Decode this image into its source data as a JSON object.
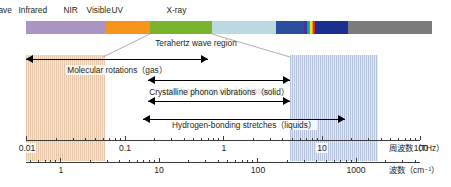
{
  "figure": {
    "background": "#ffffff"
  },
  "spectrum_bar": {
    "segments": [
      {
        "name": "radio-wave",
        "color": "#ab94c0",
        "x": 26,
        "w": 80
      },
      {
        "name": "microwave",
        "color": "#f7941e",
        "x": 106,
        "w": 44
      },
      {
        "name": "terahertz-wave",
        "color": "#7ab32e",
        "x": 150,
        "w": 62
      },
      {
        "name": "infrared",
        "color": "#bcd8e0",
        "x": 212,
        "w": 64
      },
      {
        "name": "nir",
        "color": "#2b4f9e",
        "x": 276,
        "w": 28
      },
      {
        "name": "visible-violet",
        "color": "#5b2d8e",
        "x": 304,
        "w": 1.5
      },
      {
        "name": "visible-blue",
        "color": "#1c3fa0",
        "x": 305.5,
        "w": 1.5
      },
      {
        "name": "visible-cyan",
        "color": "#00a7c4",
        "x": 307,
        "w": 1.5
      },
      {
        "name": "visible-green",
        "color": "#42b54a",
        "x": 308.5,
        "w": 1.5
      },
      {
        "name": "visible-yellow",
        "color": "#f6e600",
        "x": 310,
        "w": 1.5
      },
      {
        "name": "visible-orange",
        "color": "#f7941e",
        "x": 311.5,
        "w": 1.5
      },
      {
        "name": "visible-red",
        "color": "#e0252b",
        "x": 313,
        "w": 2
      },
      {
        "name": "uv",
        "color": "#1b2f91",
        "x": 315,
        "w": 33
      },
      {
        "name": "x-ray",
        "color": "#7b7b7b",
        "x": 348,
        "w": 84
      }
    ],
    "top": 21,
    "height": 13,
    "labels": [
      {
        "name": "radio-wave",
        "text": "Radio wave",
        "cx": 66,
        "y": 5
      },
      {
        "name": "microwave",
        "text": "Microwave",
        "cx": 128,
        "y": 5
      },
      {
        "name": "terahertz-wave",
        "text": "Terahertz wave",
        "cx": 181,
        "y": 5
      },
      {
        "name": "infrared",
        "text": "Infrared",
        "cx": 244,
        "y": 5
      },
      {
        "name": "nir",
        "text": "NIR",
        "cx": 289,
        "y": 5
      },
      {
        "name": "visible",
        "text": "Visible",
        "cx": 312,
        "y": 5
      },
      {
        "name": "uv",
        "text": "UV",
        "cx": 337,
        "y": 5
      },
      {
        "name": "x-ray",
        "text": "X-ray",
        "cx": 392,
        "y": 5
      }
    ]
  },
  "bands": [
    {
      "name": "terahertz-band-low",
      "color": "orange",
      "x": 26,
      "w": 79,
      "top": 55,
      "h": 106
    },
    {
      "name": "terahertz-band-high",
      "color": "blue",
      "x": 290,
      "w": 88,
      "top": 55,
      "h": 106
    }
  ],
  "callout": {
    "label": "Terahertz wave region",
    "label_cx": 196,
    "label_y": 38,
    "left_top_x": 150,
    "right_top_x": 212,
    "top_y": 34,
    "left_bottom_x": 103,
    "right_bottom_x": 290,
    "bottom_y": 57,
    "color": "#9a9a9a"
  },
  "arrows": [
    {
      "name": "molecular-rotations",
      "label": "Molecular rotations（gas）",
      "x1": 26,
      "x2": 208,
      "y": 55,
      "head_left": true,
      "head_right": true,
      "label_cx": 117,
      "label_y": 65
    },
    {
      "name": "low-frequency-bond-vibrations",
      "label": "Low frequency bond vibrations",
      "x1": 148,
      "x2": 290,
      "y": 76,
      "head_left": true,
      "head_right": true,
      "label_cx": 219,
      "label_y": 86
    },
    {
      "name": "crystalline-phonon-vibrations",
      "label": "Crystalline phonon vibrations（solid）",
      "x1": 148,
      "x2": 290,
      "y": 97,
      "head_left": true,
      "head_right": true,
      "label_cx": 219,
      "label_y": 87
    },
    {
      "name": "hydrogen-bonding-stretches",
      "label": "Hydrogen-bonding stretches（liquids）",
      "x1": 143,
      "x2": 345,
      "y": 115,
      "head_left": true,
      "head_right": true,
      "label_cx": 244,
      "label_y": 120
    }
  ],
  "axes": [
    {
      "name": "frequency-axis",
      "title": "周波数（THz）",
      "title_x": 389,
      "unit_html": "",
      "line_y": 140,
      "x_start": 26,
      "x_end": 420,
      "label_y": 143,
      "decades": [
        {
          "label": "0.01",
          "x": 26
        },
        {
          "label": "0.1",
          "x": 124
        },
        {
          "label": "1",
          "x": 223
        },
        {
          "label": "10",
          "x": 321
        },
        {
          "label": "100",
          "x": 420
        }
      ]
    },
    {
      "name": "wavenumber-axis",
      "title": "波数（cm⁻¹）",
      "title_x": 389,
      "line_y": 162,
      "x_start": 26,
      "x_end": 420,
      "label_y": 165,
      "decades": [
        {
          "label": "1",
          "x": 60
        },
        {
          "label": "10",
          "x": 158
        },
        {
          "label": "100",
          "x": 257
        },
        {
          "label": "1000",
          "x": 355
        }
      ]
    }
  ]
}
